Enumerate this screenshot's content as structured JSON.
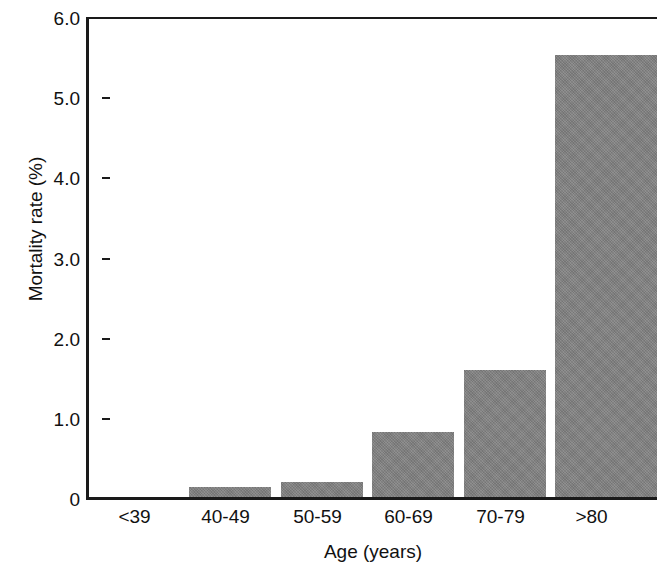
{
  "chart_data": {
    "type": "bar",
    "title": "",
    "xlabel": "Age (years)",
    "ylabel": "Mortality rate (%)",
    "categories": [
      "<39",
      "40-49",
      "50-59",
      "60-69",
      "70-79",
      ">80"
    ],
    "values": [
      0,
      0.12,
      0.19,
      0.82,
      1.59,
      5.55
    ],
    "ylim": [
      0,
      6.0
    ],
    "ytick_labels": [
      "6.0",
      "5.0",
      "4.0",
      "3.0",
      "2.0",
      "1.0",
      "0"
    ],
    "ytick_values": [
      6.0,
      5.0,
      4.0,
      3.0,
      2.0,
      1.0,
      0
    ],
    "grid": false,
    "legend": null,
    "bar_color": "#808080",
    "axis_color": "#1a1a1a",
    "background_color": "#ffffff"
  }
}
